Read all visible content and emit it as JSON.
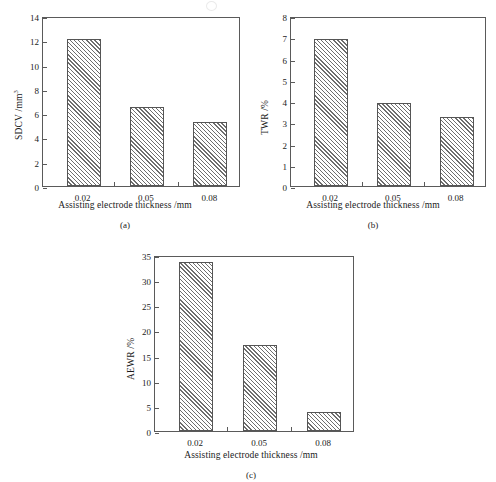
{
  "figure": {
    "background": "#ffffff",
    "line_color": "#5a5a5a",
    "hatch_color": "#6e6e6e",
    "shared_xlabel": "Assisting electrode thickness /mm",
    "categories": [
      "0.02",
      "0.05",
      "0.08"
    ]
  },
  "chart_data": [
    {
      "type": "bar",
      "panel": "(a)",
      "title": "",
      "categories": [
        "0.02",
        "0.05",
        "0.08"
      ],
      "values": [
        12.1,
        6.5,
        5.3
      ],
      "xlabel": "Assisting electrode thickness /mm",
      "ylabel": "SDCV /mm",
      "ylabel_sup": "3",
      "ylim": [
        0,
        14
      ],
      "yticks": [
        0,
        2,
        4,
        6,
        8,
        10,
        12,
        14
      ],
      "ytick_labels": [
        "0",
        "2",
        "4",
        "6",
        "8",
        "10",
        "12",
        "14"
      ],
      "grid": false,
      "legend": "none"
    },
    {
      "type": "bar",
      "panel": "(b)",
      "title": "",
      "categories": [
        "0.02",
        "0.05",
        "0.08"
      ],
      "values": [
        6.9,
        3.9,
        3.25
      ],
      "xlabel": "Assisting electrode thickness /mm",
      "ylabel": "TWR /%",
      "ylabel_sup": "",
      "ylim": [
        0,
        8
      ],
      "yticks": [
        0,
        1,
        2,
        3,
        4,
        5,
        6,
        7,
        8
      ],
      "ytick_labels": [
        "0",
        "1",
        "2",
        "3",
        "4",
        "5",
        "6",
        "7",
        "8"
      ],
      "grid": false,
      "legend": "none"
    },
    {
      "type": "bar",
      "panel": "(c)",
      "title": "",
      "categories": [
        "0.02",
        "0.05",
        "0.08"
      ],
      "values": [
        33.6,
        17.2,
        3.7
      ],
      "xlabel": "Assisting electrode thickness /mm",
      "ylabel": "AEWR /%",
      "ylabel_sup": "",
      "ylim": [
        0,
        35
      ],
      "yticks": [
        0,
        5,
        10,
        15,
        20,
        25,
        30,
        35
      ],
      "ytick_labels": [
        "0",
        "5",
        "10",
        "15",
        "20",
        "25",
        "30",
        "35"
      ],
      "grid": false,
      "legend": "none"
    }
  ],
  "captions": {
    "a": "(a)",
    "b": "(b)",
    "c": "(c)"
  }
}
